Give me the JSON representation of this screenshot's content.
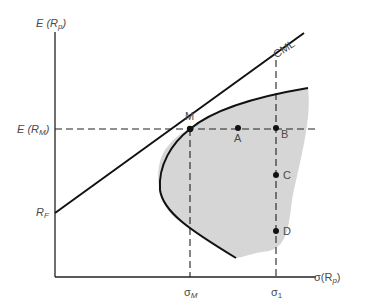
{
  "diagram": {
    "y_axis_label": "E (R",
    "y_axis_label_sub": "p",
    "y_axis_label_close": ")",
    "x_axis_label": "σ(R",
    "x_axis_label_sub": "p",
    "x_axis_label_close": ")",
    "erm_label": "E (R",
    "erm_label_sub": "M",
    "erm_label_close": ")",
    "rf_label": "R",
    "rf_label_sub": "F",
    "cml_label": "CML",
    "market_point_label": "M",
    "sigma_m_label": "σ",
    "sigma_m_sub": "M",
    "sigma_1_label": "σ",
    "sigma_1_sub": "1",
    "points": [
      {
        "label": "A",
        "x": 238,
        "y": 128
      },
      {
        "label": "B",
        "x": 276,
        "y": 128
      },
      {
        "label": "C",
        "x": 276,
        "y": 175
      },
      {
        "label": "D",
        "x": 276,
        "y": 231
      }
    ],
    "colors": {
      "axis": "#222222",
      "line": "#111111",
      "shade": "#d4d4d4",
      "text": "#4a4a4a"
    }
  }
}
